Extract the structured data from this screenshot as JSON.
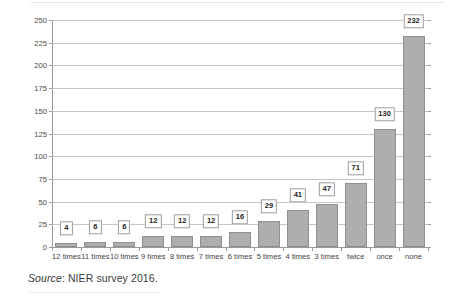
{
  "chart_data": {
    "type": "bar",
    "title": "",
    "subtitle": "",
    "xlabel": "",
    "ylabel": "",
    "categories": [
      "12 times",
      "11 times",
      "10 times",
      "9 times",
      "8 times",
      "7 times",
      "6 times",
      "5 times",
      "4 times",
      "3 times",
      "twice",
      "once",
      "none"
    ],
    "values": [
      4,
      6,
      6,
      12,
      12,
      12,
      16,
      29,
      41,
      47,
      71,
      130,
      232
    ],
    "ylim": [
      0,
      250
    ],
    "yticks": [
      0,
      25,
      50,
      75,
      100,
      125,
      150,
      175,
      200,
      225,
      250
    ],
    "ytick_labels": [
      "0",
      "25",
      "50",
      "75",
      "100",
      "125",
      "150",
      "175",
      "200",
      "225",
      "250"
    ],
    "grid": "horizontal",
    "legend": "none",
    "data_labels": true,
    "bar_color": "#aeaeae",
    "bar_border_color": "#8f8f8f",
    "gridline_color": "#c6c6c6",
    "axis_color": "#9a9a9a",
    "label_box_background": "#ffffff",
    "label_box_border": "#9d9d9d"
  },
  "source_note": {
    "label": "Source",
    "separator": ": ",
    "text": "NIER survey 2016."
  }
}
